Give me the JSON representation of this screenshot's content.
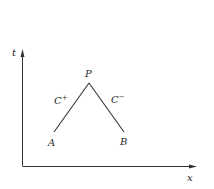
{
  "diagram": {
    "type": "characteristics-diagram",
    "axes": {
      "x_label": "x",
      "y_label": "t",
      "color": "#333333"
    },
    "points": {
      "P": {
        "label": "P",
        "x": 89,
        "y": 83
      },
      "A": {
        "label": "A",
        "x": 54,
        "y": 132
      },
      "B": {
        "label": "B",
        "x": 124,
        "y": 132
      }
    },
    "curves": {
      "left": {
        "label": "C",
        "superscript": "+",
        "from": "A",
        "to": "P"
      },
      "right": {
        "label": "C",
        "superscript": "−",
        "from": "B",
        "to": "P"
      }
    },
    "line_color": "#333333"
  }
}
